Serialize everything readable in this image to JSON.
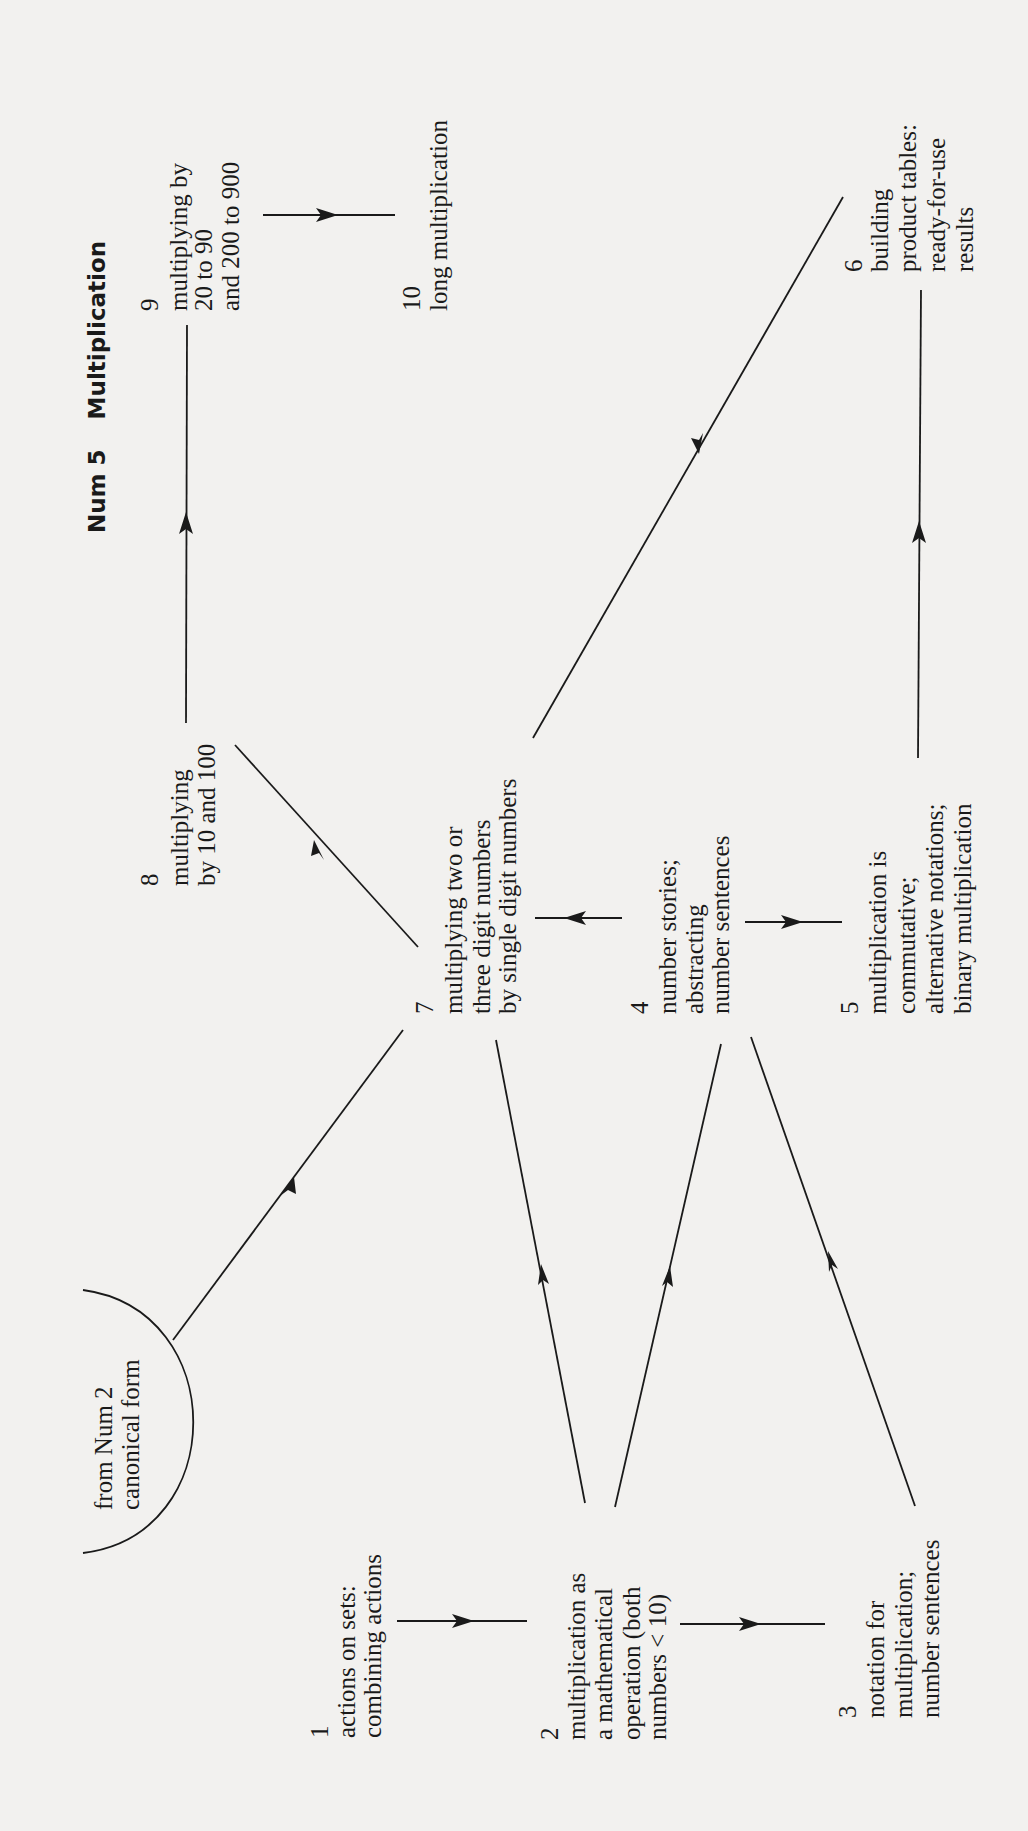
{
  "title": {
    "code": "Num 5",
    "name": "Multiplication"
  },
  "source": {
    "lines": [
      "from Num 2",
      "canonical form"
    ]
  },
  "nodes": [
    {
      "id": "1",
      "number": "1",
      "lines": [
        "actions on sets:",
        "combining actions"
      ]
    },
    {
      "id": "2",
      "number": "2",
      "lines": [
        "multiplication as",
        "a mathematical",
        "operation (both",
        "numbers < 10)"
      ]
    },
    {
      "id": "3",
      "number": "3",
      "lines": [
        "notation for",
        "multiplication;",
        "number sentences"
      ]
    },
    {
      "id": "4",
      "number": "4",
      "lines": [
        "number stories;",
        "abstracting",
        "number sentences"
      ]
    },
    {
      "id": "5",
      "number": "5",
      "lines": [
        "multiplication is",
        "commutative;",
        "alternative notations;",
        "binary multiplication"
      ]
    },
    {
      "id": "6",
      "number": "6",
      "lines": [
        "building",
        "product tables:",
        "ready-for-use",
        "results"
      ]
    },
    {
      "id": "7",
      "number": "7",
      "lines": [
        "multiplying two or",
        "three digit numbers",
        "by single digit numbers"
      ]
    },
    {
      "id": "8",
      "number": "8",
      "lines": [
        "multiplying",
        "by 10 and 100"
      ]
    },
    {
      "id": "9",
      "number": "9",
      "lines": [
        "multiplying by",
        "20 to 90",
        "and 200 to 900"
      ]
    },
    {
      "id": "10",
      "number": "10",
      "lines": [
        "long multiplication"
      ]
    }
  ],
  "edges": [
    {
      "from": "Num 2",
      "to": "7"
    },
    {
      "from": "1",
      "to": "2"
    },
    {
      "from": "2",
      "to": "3"
    },
    {
      "from": "2",
      "to": "7"
    },
    {
      "from": "2",
      "to": "4"
    },
    {
      "from": "3",
      "to": "4"
    },
    {
      "from": "4",
      "to": "7"
    },
    {
      "from": "4",
      "to": "5"
    },
    {
      "from": "5",
      "to": "6"
    },
    {
      "from": "6",
      "to": "7"
    },
    {
      "from": "7",
      "to": "8"
    },
    {
      "from": "8",
      "to": "9"
    },
    {
      "from": "9",
      "to": "10"
    }
  ],
  "colors": {
    "ink": "#1a1a1a",
    "paper": "#f2f1ef"
  }
}
